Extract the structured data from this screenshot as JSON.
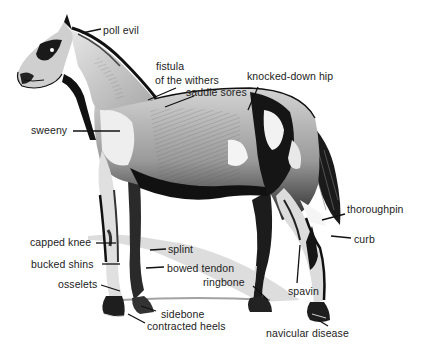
{
  "diagram": {
    "view": "left side profile",
    "labels": [
      {
        "id": "poll-evil",
        "text": "poll evil",
        "x": 103,
        "y": 24
      },
      {
        "id": "fistula-1",
        "text": "fistula",
        "x": 156,
        "y": 60
      },
      {
        "id": "fistula-2",
        "text": "of the withers",
        "x": 155,
        "y": 74
      },
      {
        "id": "saddle-sores",
        "text": "saddle sores",
        "x": 186,
        "y": 86
      },
      {
        "id": "knocked-down-hip",
        "text": "knocked-down hip",
        "x": 247,
        "y": 70
      },
      {
        "id": "sweeny",
        "text": "sweeny",
        "x": 31,
        "y": 124
      },
      {
        "id": "thoroughpin",
        "text": "thoroughpin",
        "x": 347,
        "y": 203
      },
      {
        "id": "curb",
        "text": "curb",
        "x": 354,
        "y": 233
      },
      {
        "id": "capped-knee",
        "text": "capped knee",
        "x": 30,
        "y": 236
      },
      {
        "id": "splint",
        "text": "splint",
        "x": 168,
        "y": 243
      },
      {
        "id": "bucked-shins",
        "text": "bucked shins",
        "x": 31,
        "y": 258
      },
      {
        "id": "bowed-tendon",
        "text": "bowed tendon",
        "x": 167,
        "y": 262
      },
      {
        "id": "ringbone",
        "text": "ringbone",
        "x": 203,
        "y": 276
      },
      {
        "id": "osselets",
        "text": "osselets",
        "x": 58,
        "y": 278
      },
      {
        "id": "spavin",
        "text": "spavin",
        "x": 288,
        "y": 285
      },
      {
        "id": "sidebone",
        "text": "sidebone",
        "x": 161,
        "y": 308
      },
      {
        "id": "contracted-heels",
        "text": "contracted heels",
        "x": 147,
        "y": 320
      },
      {
        "id": "navicular-disease",
        "text": "navicular disease",
        "x": 266,
        "y": 327
      }
    ],
    "colors": {
      "ink": "#111111",
      "mid_gray": "#8a8a8a",
      "light_gray": "#c8c8c8",
      "background": "#ffffff",
      "text": "#222222"
    }
  }
}
